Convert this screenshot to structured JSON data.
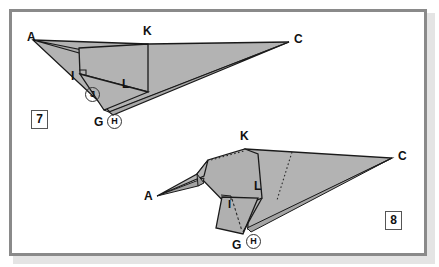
{
  "page": {
    "kind": "origami-instruction-diagram",
    "background_color": "#ffffff",
    "frame_color": "#8a8a8a",
    "paper_fill": "#b3b3b3",
    "paper_fill_dark": "#9d9d9d",
    "line_color": "#1a1a1a"
  },
  "figures": [
    {
      "id": "figure-7",
      "step_number": "7",
      "labels": [
        {
          "name": "label-a",
          "text": "A",
          "x": 27,
          "y": 36
        },
        {
          "name": "label-k",
          "text": "K",
          "x": 142,
          "y": 30
        },
        {
          "name": "label-c",
          "text": "C",
          "x": 292,
          "y": 38
        },
        {
          "name": "label-i",
          "text": "I",
          "x": 72,
          "y": 75
        },
        {
          "name": "label-l",
          "text": "L",
          "x": 123,
          "y": 82
        },
        {
          "name": "label-g",
          "text": "G",
          "x": 95,
          "y": 120
        }
      ],
      "circled_labels": [
        {
          "name": "label-j-circled",
          "text": "J",
          "x": 86,
          "y": 92
        },
        {
          "name": "label-h-circled",
          "text": "H",
          "x": 110,
          "y": 118
        }
      ]
    },
    {
      "id": "figure-8",
      "step_number": "8",
      "labels": [
        {
          "name": "label-k",
          "text": "K",
          "x": 239,
          "y": 130
        },
        {
          "name": "label-c",
          "text": "C",
          "x": 396,
          "y": 155
        },
        {
          "name": "label-a",
          "text": "A",
          "x": 146,
          "y": 192
        },
        {
          "name": "label-l",
          "text": "L",
          "x": 256,
          "y": 185
        },
        {
          "name": "label-i",
          "text": "I",
          "x": 230,
          "y": 202
        },
        {
          "name": "label-g",
          "text": "G",
          "x": 234,
          "y": 243
        }
      ],
      "circled_labels": [
        {
          "name": "label-h-circled",
          "text": "H",
          "x": 248,
          "y": 238
        }
      ]
    }
  ]
}
